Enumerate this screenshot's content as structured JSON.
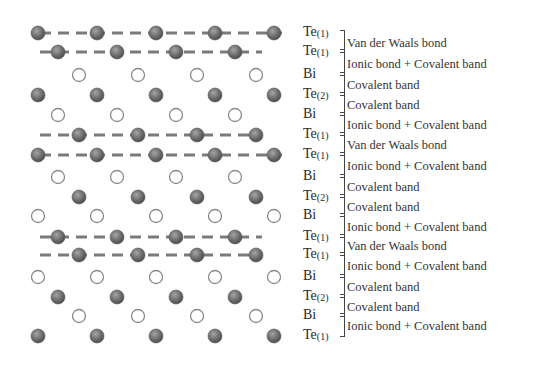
{
  "diagram": {
    "type": "crystal-structure",
    "atom_colors": {
      "Te": "#6e6e6e",
      "Bi": "#ffffff",
      "Bi_stroke": "#8a8a8a",
      "bond_dash": "#7a7a7a"
    },
    "layers": [
      {
        "element": "Te",
        "label": "Te",
        "index": "(1)",
        "x0": 38,
        "count": 5,
        "y": 33,
        "dashed": true
      },
      {
        "element": "Te",
        "label": "Te",
        "index": "(1)",
        "x0": 58,
        "count": 4,
        "y": 52,
        "dashed": true
      },
      {
        "element": "Bi",
        "label": "Bi",
        "index": "",
        "x0": 79,
        "count": 4,
        "y": 75,
        "dashed": false
      },
      {
        "element": "Te",
        "label": "Te",
        "index": "(2)",
        "x0": 38,
        "count": 5,
        "y": 95,
        "dashed": false
      },
      {
        "element": "Bi",
        "label": "Bi",
        "index": "",
        "x0": 58,
        "count": 4,
        "y": 115,
        "dashed": false
      },
      {
        "element": "Te",
        "label": "Te",
        "index": "(1)",
        "x0": 79,
        "count": 4,
        "y": 135,
        "dashed": true
      },
      {
        "element": "Te",
        "label": "Te",
        "index": "(1)",
        "x0": 38,
        "count": 5,
        "y": 155,
        "dashed": true
      },
      {
        "element": "Bi",
        "label": "Bi",
        "index": "",
        "x0": 58,
        "count": 4,
        "y": 177,
        "dashed": false
      },
      {
        "element": "Te",
        "label": "Te",
        "index": "(2)",
        "x0": 79,
        "count": 4,
        "y": 197,
        "dashed": false
      },
      {
        "element": "Bi",
        "label": "Bi",
        "index": "",
        "x0": 38,
        "count": 5,
        "y": 216,
        "dashed": false
      },
      {
        "element": "Te",
        "label": "Te",
        "index": "(1)",
        "x0": 58,
        "count": 4,
        "y": 237,
        "dashed": true
      },
      {
        "element": "Te",
        "label": "Te",
        "index": "(1)",
        "x0": 79,
        "count": 4,
        "y": 255,
        "dashed": true
      },
      {
        "element": "Bi",
        "label": "Bi",
        "index": "",
        "x0": 38,
        "count": 5,
        "y": 277,
        "dashed": false
      },
      {
        "element": "Te",
        "label": "Te",
        "index": "(2)",
        "x0": 58,
        "count": 4,
        "y": 297,
        "dashed": false
      },
      {
        "element": "Bi",
        "label": "Bi",
        "index": "",
        "x0": 79,
        "count": 4,
        "y": 316,
        "dashed": false
      },
      {
        "element": "Te",
        "label": "Te",
        "index": "(1)",
        "x0": 38,
        "count": 5,
        "y": 336,
        "dashed": false
      }
    ],
    "spacing": 59,
    "bonds": [
      {
        "text": "Van der Waals bond",
        "from": 0,
        "to": 1
      },
      {
        "text": "Ionic bond + Covalent band",
        "from": 1,
        "to": 2
      },
      {
        "text": "Covalent band",
        "from": 2,
        "to": 3
      },
      {
        "text": "Covalent band",
        "from": 3,
        "to": 4
      },
      {
        "text": "Ionic bond + Covalent band",
        "from": 4,
        "to": 5
      },
      {
        "text": "Van der Waals bond",
        "from": 5,
        "to": 6
      },
      {
        "text": "Ionic bond + Covalent band",
        "from": 6,
        "to": 7
      },
      {
        "text": "Covalent band",
        "from": 7,
        "to": 8
      },
      {
        "text": "Covalent band",
        "from": 8,
        "to": 9
      },
      {
        "text": "Ionic bond + Covalent band",
        "from": 9,
        "to": 10
      },
      {
        "text": "Van der Waals bond",
        "from": 10,
        "to": 11
      },
      {
        "text": "Ionic bond + Covalent band",
        "from": 11,
        "to": 12
      },
      {
        "text": "Covalent band",
        "from": 12,
        "to": 13
      },
      {
        "text": "Covalent band",
        "from": 13,
        "to": 14
      },
      {
        "text": "Ionic bond + Covalent band",
        "from": 14,
        "to": 15
      }
    ]
  }
}
